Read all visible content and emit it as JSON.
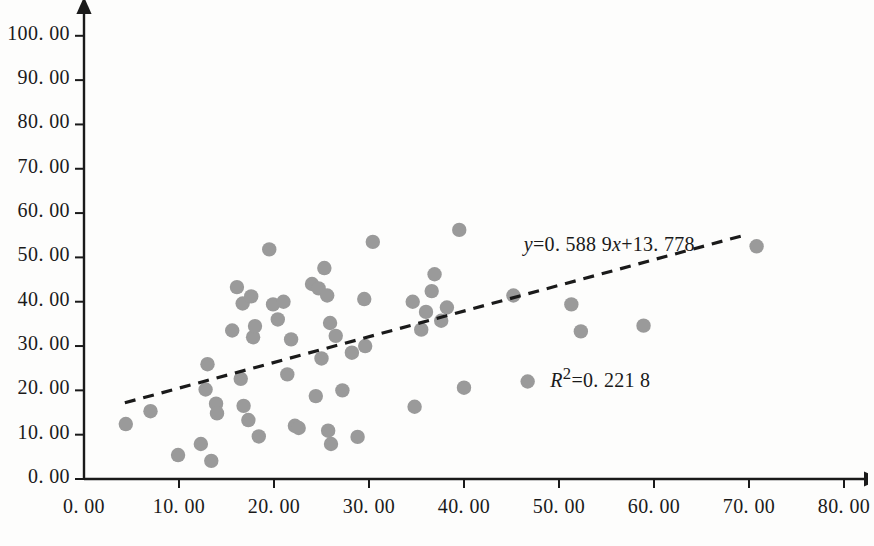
{
  "chart_data": {
    "type": "scatter",
    "title": "",
    "subtitle": "",
    "xlabel": "",
    "ylabel": "",
    "xlim": [
      0,
      80
    ],
    "ylim": [
      0,
      100
    ],
    "grid": false,
    "legend": null,
    "marker_color": "#9a9a9a",
    "axis_color": "#1a1a1a",
    "background_color": "#fdfdfc",
    "x_ticks": [
      "0. 00",
      "10. 00",
      "20. 00",
      "30. 00",
      "40. 00",
      "50. 00",
      "60. 00",
      "70. 00",
      "80. 00"
    ],
    "x_tick_values": [
      0,
      10,
      20,
      30,
      40,
      50,
      60,
      70,
      80
    ],
    "y_ticks": [
      "0. 00",
      "10. 00",
      "20. 00",
      "30. 00",
      "40. 00",
      "50. 00",
      "60. 00",
      "70. 00",
      "80. 00",
      "90. 00",
      "100. 00"
    ],
    "y_tick_values": [
      0,
      10,
      20,
      30,
      40,
      50,
      60,
      70,
      80,
      90,
      100
    ],
    "points": [
      [
        4.4,
        12.4
      ],
      [
        7.0,
        15.3
      ],
      [
        9.9,
        5.4
      ],
      [
        12.3,
        7.9
      ],
      [
        13.0,
        25.9
      ],
      [
        12.8,
        20.2
      ],
      [
        13.4,
        4.1
      ],
      [
        13.9,
        17.0
      ],
      [
        14.0,
        14.8
      ],
      [
        15.6,
        33.5
      ],
      [
        16.1,
        43.3
      ],
      [
        16.7,
        39.6
      ],
      [
        16.5,
        22.6
      ],
      [
        16.8,
        16.5
      ],
      [
        17.3,
        13.3
      ],
      [
        17.6,
        41.2
      ],
      [
        17.8,
        32.0
      ],
      [
        18.0,
        34.5
      ],
      [
        18.4,
        9.6
      ],
      [
        19.5,
        51.8
      ],
      [
        19.9,
        39.4
      ],
      [
        20.4,
        36.0
      ],
      [
        21.0,
        40.0
      ],
      [
        21.4,
        23.6
      ],
      [
        21.8,
        31.5
      ],
      [
        22.2,
        12.0
      ],
      [
        22.6,
        11.5
      ],
      [
        24.0,
        44.0
      ],
      [
        24.4,
        18.7
      ],
      [
        24.7,
        43.0
      ],
      [
        25.0,
        27.2
      ],
      [
        25.3,
        47.6
      ],
      [
        25.6,
        41.4
      ],
      [
        25.9,
        35.2
      ],
      [
        25.7,
        10.9
      ],
      [
        26.0,
        7.9
      ],
      [
        26.5,
        32.3
      ],
      [
        27.2,
        20.0
      ],
      [
        28.2,
        28.5
      ],
      [
        28.8,
        9.5
      ],
      [
        29.6,
        30.0
      ],
      [
        29.5,
        40.6
      ],
      [
        30.4,
        53.5
      ],
      [
        34.6,
        40.0
      ],
      [
        34.8,
        16.3
      ],
      [
        35.5,
        33.7
      ],
      [
        36.0,
        37.7
      ],
      [
        36.6,
        42.4
      ],
      [
        36.9,
        46.2
      ],
      [
        37.6,
        35.7
      ],
      [
        38.2,
        38.7
      ],
      [
        39.5,
        56.2
      ],
      [
        40.0,
        20.6
      ],
      [
        45.2,
        41.4
      ],
      [
        46.7,
        22.0
      ],
      [
        51.3,
        39.4
      ],
      [
        52.3,
        33.3
      ],
      [
        58.9,
        34.6
      ],
      [
        70.8,
        52.5
      ]
    ],
    "trendline": {
      "type": "dashed",
      "color": "#1a1a1a",
      "equation": "y=0. 588 9x+13. 778",
      "slope": 0.5889,
      "intercept": 13.778,
      "x_start": 4.3,
      "x_end": 69.5,
      "y_start": 17.2,
      "y_end": 55.0
    },
    "annotations": {
      "equation_y_prefix": "y",
      "equation_y_body": "=0. 588 9",
      "equation_x_var": "x",
      "equation_tail": "+13. 778",
      "r_squared_var": "R",
      "r_squared_exp": "2",
      "r_squared_body": "=0. 221 8",
      "equation_line": "y=0. 588 9x+13. 778",
      "r_squared_line": "R²=0. 221 8",
      "r_squared_value": 0.2218
    }
  }
}
